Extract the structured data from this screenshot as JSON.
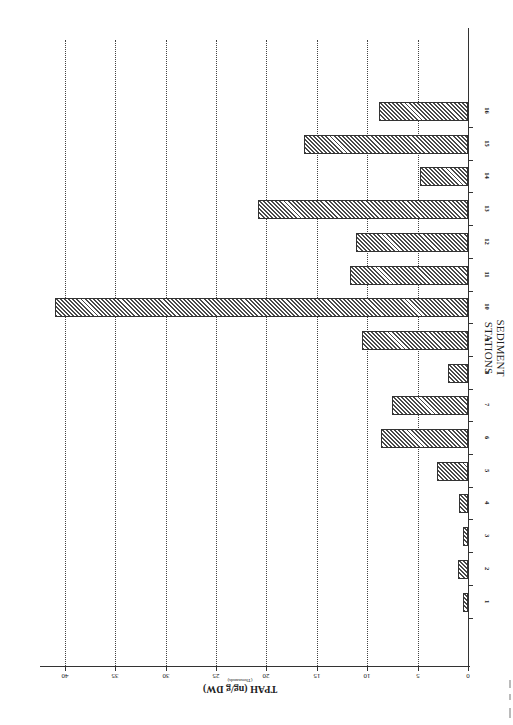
{
  "chart_data": {
    "type": "bar",
    "orientation": "rotated-90 (horizontal bars extending leftward from baseline at right)",
    "title": "",
    "xlabel": "SEDIMENT STATIONS",
    "ylabel": "TPAH (ng/g DW)",
    "ylabel_sub": "(Thousands)",
    "ylim": [
      0,
      40
    ],
    "yticks": [
      0,
      5,
      10,
      15,
      20,
      25,
      30,
      35,
      40
    ],
    "grid": "dotted, major y ticks",
    "legend": null,
    "categories": [
      "1",
      "2",
      "3",
      "4",
      "5",
      "6",
      "7",
      "8",
      "9",
      "10",
      "11",
      "12",
      "13",
      "14",
      "15",
      "16"
    ],
    "values": [
      0.5,
      1.0,
      0.5,
      0.9,
      3.1,
      8.6,
      7.5,
      2.0,
      10.5,
      41.0,
      11.7,
      11.1,
      20.8,
      4.8,
      16.3,
      8.8
    ],
    "fill_pattern": "diagonal hatch"
  },
  "labels": {
    "x_title": "SEDIMENT STATIONS",
    "y_title": "TPAH (ng/g DW)",
    "y_sub": "(Thousands)"
  },
  "ticks": {
    "y": [
      "0",
      "5",
      "10",
      "15",
      "20",
      "25",
      "30",
      "35",
      "40"
    ]
  },
  "colors": {
    "bar_hatch": "#4a4a4a",
    "bar_border": "#333333",
    "grid": "#444444",
    "background": "#ffffff"
  }
}
